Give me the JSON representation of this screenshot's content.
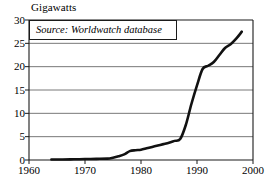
{
  "chart_data": {
    "type": "line",
    "title": "Gigawatts",
    "ylabel": "Gigawatts",
    "xlabel": "",
    "annotation": "Source: Worldwatch database",
    "grid": true,
    "legend": "none",
    "xlim": [
      1960,
      2000
    ],
    "ylim": [
      0,
      30
    ],
    "xticks": [
      1960,
      1970,
      1980,
      1990,
      2000
    ],
    "yticks": [
      0,
      5,
      10,
      15,
      20,
      25,
      30
    ],
    "xtick_labels": [
      "1960",
      "1970",
      "1980",
      "1990",
      "2000"
    ],
    "ytick_labels": [
      "0",
      "5",
      "10",
      "15",
      "20",
      "25",
      "30"
    ],
    "series": [
      {
        "name": "Installed wind capacity",
        "x": [
          1964,
          1966,
          1968,
          1970,
          1972,
          1974,
          1975,
          1976,
          1977,
          1978,
          1979,
          1980,
          1981,
          1982,
          1983,
          1984,
          1985,
          1986,
          1987,
          1988,
          1989,
          1990,
          1991,
          1992,
          1993,
          1994,
          1995,
          1996,
          1997,
          1998
        ],
        "values": [
          0.1,
          0.1,
          0.15,
          0.2,
          0.25,
          0.3,
          0.5,
          0.8,
          1.2,
          1.9,
          2.1,
          2.2,
          2.5,
          2.8,
          3.1,
          3.4,
          3.7,
          4.1,
          4.5,
          7.5,
          12.0,
          16.0,
          19.5,
          20.2,
          21.0,
          22.5,
          24.0,
          24.8,
          26.0,
          27.5
        ]
      }
    ]
  },
  "plot": {
    "left": 29,
    "right": 253,
    "top": 20,
    "bottom": 160
  }
}
